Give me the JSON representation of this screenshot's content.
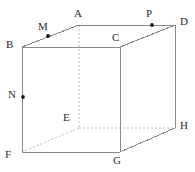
{
  "figure": {
    "width": 195,
    "height": 172,
    "background": "#ffffff",
    "solid_edge_color": "#8a8a8a",
    "hidden_edge_color": "#b8b8b8",
    "dot_color": "#1a1a1a",
    "label_color": "#2b2b2b"
  },
  "vertices": {
    "A": {
      "label": "A",
      "x": 79,
      "y": 25,
      "label_x": 74,
      "label_y": 8,
      "hidden": false
    },
    "B": {
      "label": "B",
      "x": 22,
      "y": 47,
      "label_x": 6,
      "label_y": 39,
      "hidden": false
    },
    "C": {
      "label": "C",
      "x": 120,
      "y": 47,
      "label_x": 112,
      "label_y": 32,
      "hidden": false
    },
    "D": {
      "label": "D",
      "x": 175,
      "y": 25,
      "label_x": 180,
      "label_y": 16,
      "hidden": false
    },
    "E": {
      "label": "E",
      "x": 79,
      "y": 128,
      "label_x": 63,
      "label_y": 112,
      "hidden": true
    },
    "F": {
      "label": "F",
      "x": 22,
      "y": 152,
      "label_x": 5,
      "label_y": 149,
      "hidden": false
    },
    "G": {
      "label": "G",
      "x": 120,
      "y": 152,
      "label_x": 113,
      "label_y": 155,
      "hidden": false
    },
    "H": {
      "label": "H",
      "x": 175,
      "y": 128,
      "label_x": 180,
      "label_y": 120,
      "hidden": false
    }
  },
  "points": [
    {
      "label": "M",
      "x": 48,
      "y": 36,
      "label_x": 38,
      "label_y": 21,
      "on_segment": "B-A"
    },
    {
      "label": "N",
      "x": 23,
      "y": 97,
      "label_x": 8,
      "label_y": 89,
      "on_segment": "B-F"
    },
    {
      "label": "P",
      "x": 152,
      "y": 25,
      "label_x": 146,
      "label_y": 8,
      "on_segment": "A-D"
    }
  ],
  "edges": [
    {
      "name": "B-C",
      "from": "B",
      "to": "C",
      "hidden": false
    },
    {
      "name": "C-G",
      "from": "C",
      "to": "G",
      "hidden": false
    },
    {
      "name": "G-F",
      "from": "G",
      "to": "F",
      "hidden": false
    },
    {
      "name": "F-B",
      "from": "F",
      "to": "B",
      "hidden": false
    },
    {
      "name": "A-D",
      "from": "A",
      "to": "D",
      "hidden": false
    },
    {
      "name": "D-H",
      "from": "D",
      "to": "H",
      "hidden": false
    },
    {
      "name": "B-A",
      "from": "B",
      "to": "A",
      "hidden": false
    },
    {
      "name": "C-D",
      "from": "C",
      "to": "D",
      "hidden": false
    },
    {
      "name": "G-H",
      "from": "G",
      "to": "H",
      "hidden": false
    },
    {
      "name": "A-E",
      "from": "A",
      "to": "E",
      "hidden": true
    },
    {
      "name": "E-H",
      "from": "E",
      "to": "H",
      "hidden": true
    },
    {
      "name": "E-F",
      "from": "E",
      "to": "F",
      "hidden": true
    }
  ]
}
